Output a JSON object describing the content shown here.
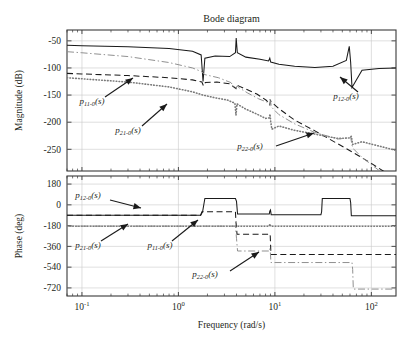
{
  "figure": {
    "title": "Bode diagram",
    "xlabel": "Frequency (rad/s)",
    "mag_ylabel": "Magnitude (dB)",
    "phase_ylabel": "Phase (deg)"
  },
  "axes": {
    "x_ticklabels": [
      "10",
      "10",
      "10",
      "10"
    ],
    "x_tickexp": [
      "-1",
      "0",
      "1",
      "2"
    ],
    "x_tickvals": [
      0.1,
      1,
      10,
      100
    ],
    "mag_ticklabels": [
      "-50",
      "-100",
      "-150",
      "-200",
      "-250"
    ],
    "mag_tickvals": [
      -50,
      -100,
      -150,
      -200,
      -250
    ],
    "phase_ticklabels": [
      "180",
      "0",
      "-180",
      "-360",
      "-540",
      "-720"
    ],
    "phase_tickvals": [
      180,
      0,
      -180,
      -360,
      -540,
      -720
    ]
  },
  "annotations": {
    "mag": [
      {
        "name": "p11",
        "base": "p",
        "sub": "11-0",
        "tail": "(s)",
        "x": 92,
        "y": 104
      },
      {
        "name": "p21",
        "base": "p",
        "sub": "21-0",
        "tail": "(s)",
        "x": 128,
        "y": 133
      },
      {
        "name": "p22",
        "base": "p",
        "sub": "22-0",
        "tail": "(s)",
        "x": 250,
        "y": 149
      },
      {
        "name": "p12",
        "base": "p",
        "sub": "12-0",
        "tail": "(s)",
        "x": 346,
        "y": 99
      }
    ],
    "phase": [
      {
        "name": "p12",
        "base": "p",
        "sub": "12-0",
        "tail": "(s)",
        "x": 88,
        "y": 198
      },
      {
        "name": "p21",
        "base": "p",
        "sub": "21-0",
        "tail": "(s)",
        "x": 88,
        "y": 248
      },
      {
        "name": "p11",
        "base": "p",
        "sub": "11-0",
        "tail": "(s)",
        "x": 160,
        "y": 248
      },
      {
        "name": "p22",
        "base": "p",
        "sub": "22-0",
        "tail": "(s)",
        "x": 205,
        "y": 277
      }
    ]
  },
  "chart_data": {
    "type": "line",
    "title": "Bode diagram",
    "xlabel": "Frequency (rad/s)",
    "xscale": "log",
    "xlim": [
      0.07,
      180
    ],
    "grid": true,
    "legend": "inline-annotations",
    "panels": [
      {
        "name": "magnitude",
        "ylabel": "Magnitude (dB)",
        "ylim": [
          -290,
          -30
        ],
        "yticks": [
          -50,
          -100,
          -150,
          -200,
          -250
        ]
      },
      {
        "name": "phase",
        "ylabel": "Phase (deg)",
        "ylim": [
          -790,
          250
        ],
        "yticks": [
          180,
          0,
          -180,
          -360,
          -540,
          -720
        ]
      }
    ],
    "series": [
      {
        "name": "p11-0(s)",
        "style": "dashed",
        "color": "#1a1a1a",
        "magnitude": {
          "x": [
            0.07,
            0.1,
            0.3,
            0.8,
            1.4,
            1.75,
            1.82,
            1.9,
            2.5,
            3.4,
            3.95,
            4.05,
            4.2,
            5,
            6.5,
            8.2,
            8.85,
            9.0,
            9.2,
            11,
            16,
            26,
            45,
            65,
            100,
            150,
            180
          ],
          "y": [
            -110,
            -111,
            -114,
            -118,
            -122,
            -126,
            -133,
            -127,
            -126,
            -129,
            -138,
            -131,
            -133,
            -139,
            -148,
            -160,
            -168,
            -160,
            -163,
            -175,
            -196,
            -216,
            -240,
            -256,
            -276,
            -296,
            -307
          ]
        },
        "phase": {
          "x": [
            0.07,
            1.7,
            1.75,
            1.85,
            3.9,
            3.95,
            4.05,
            8.7,
            8.8,
            8.95,
            9.1,
            9.3,
            180
          ],
          "y": [
            -90,
            -90,
            -60,
            -60,
            -60,
            -150,
            -255,
            -255,
            -250,
            -270,
            -430,
            -430,
            -430
          ]
        }
      },
      {
        "name": "p12-0(s)",
        "style": "solid",
        "color": "#1a1a1a",
        "magnitude": {
          "x": [
            0.07,
            0.1,
            0.3,
            0.8,
            1.4,
            1.72,
            1.8,
            1.88,
            2.4,
            3.4,
            3.9,
            3.97,
            4.08,
            5,
            7,
            8.6,
            8.85,
            9.05,
            11,
            16,
            26,
            40,
            55,
            59,
            61,
            63,
            80,
            120,
            180
          ],
          "y": [
            -58,
            -59,
            -61,
            -64,
            -69,
            -76,
            -125,
            -82,
            -78,
            -79,
            -72,
            -45,
            -72,
            -80,
            -84,
            -87,
            -82,
            -89,
            -93,
            -97,
            -99,
            -97,
            -86,
            -60,
            -90,
            -136,
            -104,
            -101,
            -100
          ]
        },
        "phase": {
          "x": [
            0.07,
            1.7,
            1.78,
            1.88,
            3.9,
            4.0,
            4.1,
            8.75,
            8.85,
            9.0,
            9.15,
            30,
            30.5,
            31,
            60,
            61,
            62,
            180
          ],
          "y": [
            -90,
            -90,
            -60,
            55,
            55,
            30,
            -80,
            -80,
            -55,
            -45,
            -85,
            -85,
            -60,
            55,
            55,
            20,
            -95,
            -95
          ]
        }
      },
      {
        "name": "p21-0(s)",
        "style": "dotted",
        "color": "#7a7a7a",
        "magnitude": {
          "x": [
            0.07,
            0.1,
            0.3,
            0.8,
            1.4,
            1.8,
            2.4,
            3.2,
            3.85,
            3.95,
            4.05,
            4.2,
            5,
            6.5,
            8.0,
            8.75,
            8.9,
            9.05,
            9.3,
            11,
            16,
            26,
            45,
            60,
            62,
            64,
            80,
            120,
            180
          ],
          "y": [
            -118,
            -120,
            -126,
            -135,
            -144,
            -150,
            -155,
            -159,
            -165,
            -187,
            -166,
            -168,
            -176,
            -185,
            -193,
            -192,
            -185,
            -199,
            -213,
            -207,
            -215,
            -222,
            -230,
            -229,
            -226,
            -241,
            -236,
            -244,
            -252
          ]
        },
        "phase": {
          "x": [
            0.07,
            1.7,
            1.8,
            3.9,
            4.0,
            4.1,
            8.75,
            8.85,
            9.05,
            9.2,
            180
          ],
          "y": [
            -185,
            -185,
            -185,
            -185,
            -185,
            -185,
            -185,
            -165,
            -185,
            -185,
            -185
          ]
        }
      },
      {
        "name": "p22-0(s)",
        "style": "dashdot",
        "color": "#8a8a8a",
        "magnitude": {
          "x": [
            0.07,
            0.1,
            0.3,
            0.8,
            1.4,
            1.75,
            1.85,
            2.6,
            3.5,
            3.95,
            4.05,
            4.3,
            5.2,
            6.8,
            8.3,
            8.85,
            9.0,
            9.2,
            11,
            16,
            26,
            45,
            58,
            61,
            63,
            66,
            80,
            120,
            180
          ],
          "y": [
            -70,
            -72,
            -79,
            -90,
            -100,
            -107,
            -112,
            -118,
            -127,
            -139,
            -133,
            -137,
            -146,
            -157,
            -163,
            -158,
            -161,
            -172,
            -186,
            -203,
            -219,
            -231,
            -229,
            -227,
            -243,
            -250,
            -265,
            -289,
            -305
          ]
        },
        "phase": {
          "x": [
            0.07,
            1.7,
            1.8,
            3.9,
            4.0,
            4.1,
            8.7,
            8.8,
            8.95,
            9.1,
            9.3,
            63,
            64,
            65,
            180
          ],
          "y": [
            -185,
            -185,
            -185,
            -185,
            -290,
            -400,
            -400,
            -380,
            -395,
            -500,
            -500,
            -500,
            -560,
            -730,
            -730
          ]
        }
      }
    ]
  }
}
